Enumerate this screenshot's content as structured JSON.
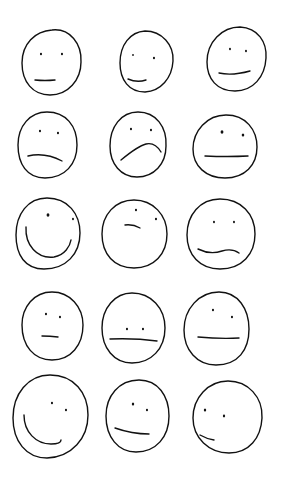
{
  "drawing": {
    "description": "Hand-drawn sketches of 15 faces with varying expressions arranged in a 3x5 grid",
    "stroke_color": "#111111",
    "background_color": "#ffffff",
    "faces": [
      {
        "expr": "neutral",
        "head": "M52,30 C70,28 82,44 81,62 C81,80 68,95 50,95 C33,95 22,82 22,63 C22,44 35,31 52,30 Z",
        "eyes": [
          [
            41,
            54,
            1.3
          ],
          [
            62,
            54,
            1.3
          ]
        ],
        "mouth": "M35,80 Q45,81 55,80"
      },
      {
        "expr": "slight-smile",
        "head": "M145,31 C162,31 174,45 173,61 C172,78 161,91 145,92 C129,92 120,80 120,63 C120,45 130,32 145,31 Z",
        "eyes": [
          [
            133,
            55,
            1.1
          ],
          [
            154,
            58,
            1.3
          ]
        ],
        "mouth": "M128,79 Q137,83 146,80"
      },
      {
        "expr": "slight-smile",
        "head": "M240,27 C258,28 267,42 266,58 C265,77 253,91 235,91 C217,91 207,79 207,62 C207,42 222,27 240,27 Z",
        "eyes": [
          [
            230,
            49,
            1.2
          ],
          [
            246,
            51,
            1.2
          ]
        ],
        "mouth": "M219,73 Q232,76 250,71"
      },
      {
        "expr": "frown",
        "head": "M47,112 C66,112 77,126 77,145 C77,164 65,178 45,178 C27,178 18,164 18,145 C18,126 30,112 47,112 Z",
        "eyes": [
          [
            40,
            131,
            1.3
          ],
          [
            58,
            133,
            1.3
          ]
        ],
        "mouth": "M28,156 Q45,152 62,161"
      },
      {
        "expr": "sad",
        "head": "M138,112 C156,112 167,127 166,146 C166,164 154,177 137,177 C121,177 110,164 110,146 C110,127 121,112 138,112 Z",
        "eyes": [
          [
            131,
            129,
            1.3
          ],
          [
            151,
            130,
            1.3
          ]
        ],
        "mouth": "M121,160 Q138,146 146,144 Q155,142 161,152"
      },
      {
        "expr": "neutral",
        "head": "M226,115 C246,115 257,130 257,147 C257,165 245,178 225,178 C206,178 193,166 193,149 C193,131 207,115 226,115 Z",
        "eyes": [
          [
            222,
            132,
            1.8
          ],
          [
            243,
            135,
            1.6
          ]
        ],
        "mouth": "M205,156 Q228,157 248,156"
      },
      {
        "expr": "big-smile",
        "head": "M47,198 C68,198 80,214 80,233 C80,254 66,269 44,269 C25,269 16,255 16,235 C16,214 28,198 47,198 Z",
        "eyes": [
          [
            48,
            215,
            1.8
          ],
          [
            73,
            219,
            1.2
          ]
        ],
        "mouth": "M26,227 C25,245 37,259 54,257 C65,255 70,246 71,240"
      },
      {
        "expr": "smirk",
        "head": "M134,200 C153,200 167,215 167,234 C167,254 154,268 134,268 C114,268 102,254 102,234 C102,215 115,200 134,200 Z",
        "eyes": [
          [
            136,
            210,
            1.3
          ],
          [
            156,
            219,
            1.3
          ]
        ],
        "mouth": "M125,225 Q133,224 140,228"
      },
      {
        "expr": "wavy",
        "head": "M220,199 C241,199 255,214 255,234 C255,254 242,269 220,269 C200,269 187,255 187,235 C187,215 200,199 220,199 Z",
        "eyes": [
          [
            214,
            222,
            1.2
          ],
          [
            234,
            222,
            1.2
          ]
        ],
        "mouth": "M198,249 Q210,255 222,251 Q232,248 239,253"
      },
      {
        "expr": "neutral",
        "head": "M52,292 C70,292 83,307 83,325 C83,345 71,360 52,360 C34,360 22,346 22,325 C22,307 34,292 52,292 Z",
        "eyes": [
          [
            46,
            314,
            1.3
          ],
          [
            60,
            317,
            1.3
          ]
        ],
        "mouth": "M42,336 Q50,336 58,337"
      },
      {
        "expr": "flat",
        "head": "M132,293 C151,293 165,308 165,328 C165,349 151,363 132,363 C114,363 102,348 102,328 C102,308 115,293 132,293 Z",
        "eyes": [
          [
            127,
            329,
            1.3
          ],
          [
            143,
            329,
            1.3
          ]
        ],
        "mouth": "M110,339 Q135,338 157,341"
      },
      {
        "expr": "flat",
        "head": "M219,292 C238,292 249,309 249,329 C249,350 238,365 216,365 C197,365 184,350 184,330 C184,309 199,292 219,292 Z",
        "eyes": [
          [
            213,
            310,
            1.3
          ],
          [
            232,
            317,
            1.3
          ]
        ],
        "mouth": "M198,337 Q220,339 239,338"
      },
      {
        "expr": "big-smile",
        "head": "M50,375 C74,375 88,393 88,415 C88,438 72,457 47,458 C26,458 13,441 13,418 C13,394 28,375 50,375 Z",
        "eyes": [
          [
            52,
            403,
            1.3
          ],
          [
            66,
            410,
            1.3
          ]
        ],
        "mouth": "M24,415 C24,432 36,444 51,444 C58,444 61,442 61,440"
      },
      {
        "expr": "smile",
        "head": "M139,380 C158,380 169,396 169,416 C169,437 156,452 136,452 C118,452 106,437 106,416 C106,396 119,380 139,380 Z",
        "eyes": [
          [
            133,
            404,
            1.5
          ],
          [
            147,
            410,
            1.3
          ]
        ],
        "mouth": "M115,428 Q132,434 149,434"
      },
      {
        "expr": "smirk",
        "head": "M228,381 C248,381 263,397 262,418 C261,438 249,453 229,453 C209,453 193,438 193,418 C193,398 208,381 228,381 Z",
        "eyes": [
          [
            205,
            410,
            1.5
          ],
          [
            224,
            416,
            1.4
          ]
        ],
        "mouth": "M200,435 Q207,439 214,440"
      }
    ]
  }
}
